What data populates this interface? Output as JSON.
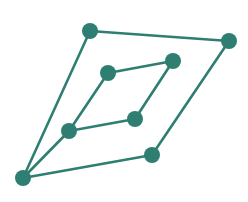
{
  "diagram": {
    "type": "graph",
    "width": 248,
    "height": 202,
    "colors": {
      "node": "#2e7f71",
      "edge": "#2e7f71",
      "background": "#ffffff"
    },
    "node_radius": 8,
    "edge_width": 2.6,
    "nodes": [
      {
        "id": "bottom",
        "x": 23,
        "y": 178
      },
      {
        "id": "inner-bottom",
        "x": 69,
        "y": 131
      },
      {
        "id": "inner-right",
        "x": 135,
        "y": 119
      },
      {
        "id": "inner-left",
        "x": 108,
        "y": 73
      },
      {
        "id": "inner-top",
        "x": 173,
        "y": 61
      },
      {
        "id": "outer-left",
        "x": 90,
        "y": 31
      },
      {
        "id": "outer-right",
        "x": 152,
        "y": 155
      },
      {
        "id": "top",
        "x": 229,
        "y": 41
      }
    ],
    "edges": [
      [
        "bottom",
        "outer-left"
      ],
      [
        "bottom",
        "inner-bottom"
      ],
      [
        "bottom",
        "outer-right"
      ],
      [
        "inner-bottom",
        "inner-left"
      ],
      [
        "inner-bottom",
        "inner-right"
      ],
      [
        "inner-left",
        "inner-top"
      ],
      [
        "inner-right",
        "inner-top"
      ],
      [
        "outer-left",
        "top"
      ],
      [
        "outer-right",
        "top"
      ]
    ]
  }
}
